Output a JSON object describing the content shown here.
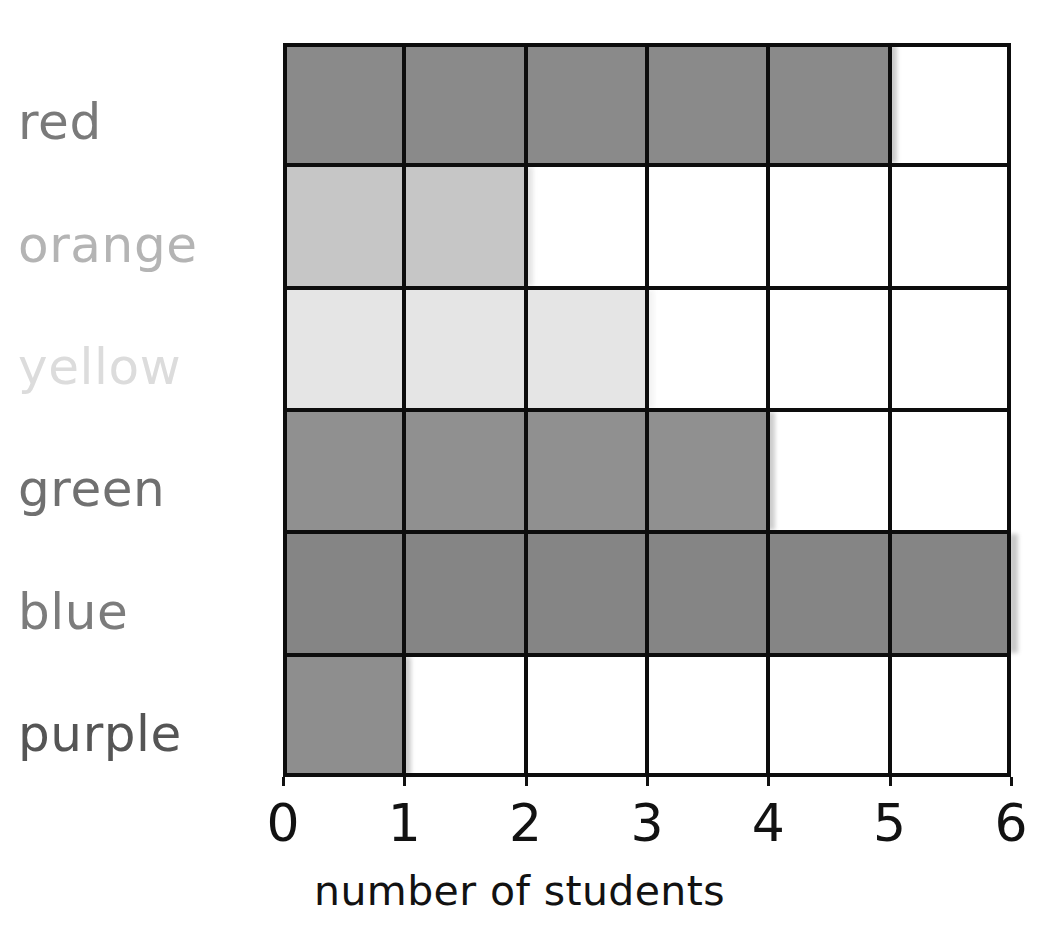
{
  "title_partial": "",
  "axis": {
    "x_title": "number of students",
    "x_ticks": [
      "0",
      "1",
      "2",
      "3",
      "4",
      "5",
      "6"
    ],
    "x_min": 0,
    "x_max": 6
  },
  "categories": [
    {
      "label": "red",
      "value": 5,
      "bar_color": "#8a8a8a",
      "label_color": "#7a7a7a"
    },
    {
      "label": "orange",
      "value": 2,
      "bar_color": "#c6c6c6",
      "label_color": "#b4b4b4"
    },
    {
      "label": "yellow",
      "value": 3,
      "bar_color": "#e5e5e5",
      "label_color": "#dcdcdc"
    },
    {
      "label": "green",
      "value": 4,
      "bar_color": "#909090",
      "label_color": "#707070"
    },
    {
      "label": "blue",
      "value": 6,
      "bar_color": "#858585",
      "label_color": "#7c7c7c"
    },
    {
      "label": "purple",
      "value": 1,
      "bar_color": "#8e8e8e",
      "label_color": "#555555"
    }
  ],
  "colors": {
    "grid_line": "#0d0d0d",
    "background": "#ffffff",
    "tick_text": "#121212"
  },
  "chart_data": {
    "type": "bar",
    "orientation": "horizontal",
    "title": "",
    "xlabel": "number of students",
    "ylabel": "",
    "categories": [
      "red",
      "orange",
      "yellow",
      "green",
      "blue",
      "purple"
    ],
    "values": [
      5,
      2,
      3,
      4,
      6,
      1
    ],
    "xlim": [
      0,
      6
    ],
    "xticks": [
      0,
      1,
      2,
      3,
      4,
      5,
      6
    ],
    "grid": true,
    "legend": "none",
    "series": [
      {
        "name": "number of students",
        "values": [
          5,
          2,
          3,
          4,
          6,
          1
        ]
      }
    ]
  }
}
